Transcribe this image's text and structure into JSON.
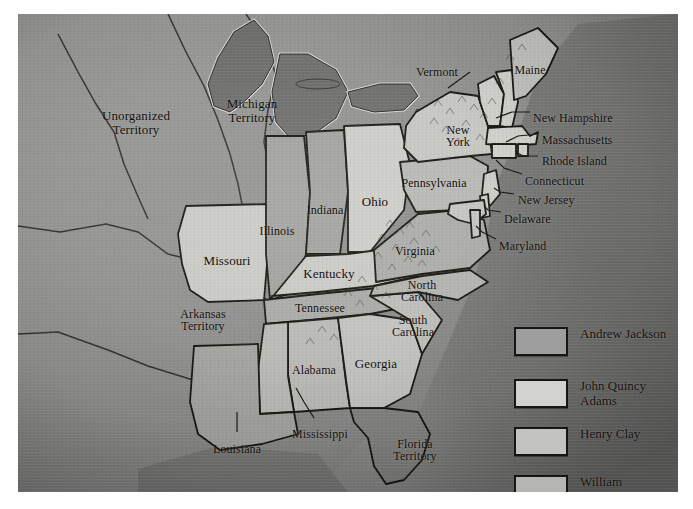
{
  "map": {
    "title_visible": false,
    "background_color": "#8e8e8e",
    "ocean_color": "#6f6f6f",
    "border_color": "#1a1713",
    "labels": [
      {
        "name": "unorganized-territory",
        "text": "Unorganized\nTerritory",
        "x": 118,
        "y": 95,
        "size": 13,
        "align": "c"
      },
      {
        "name": "michigan-territory",
        "text": "Michigan\nTerritory",
        "x": 234,
        "y": 83,
        "size": 13,
        "align": "c"
      },
      {
        "name": "missouri",
        "text": "Missouri",
        "x": 209,
        "y": 240,
        "size": 13,
        "align": "c"
      },
      {
        "name": "arkansas-territory",
        "text": "Arkansas\nTerritory",
        "x": 185,
        "y": 294,
        "size": 12,
        "align": "c"
      },
      {
        "name": "louisiana",
        "text": "Louisiana",
        "x": 219,
        "y": 429,
        "size": 12,
        "align": "c"
      },
      {
        "name": "mississippi",
        "text": "Mississippi",
        "x": 302,
        "y": 414,
        "size": 12,
        "align": "c"
      },
      {
        "name": "alabama",
        "text": "Alabama",
        "x": 296,
        "y": 350,
        "size": 12,
        "align": "c"
      },
      {
        "name": "illinois",
        "text": "Illinois",
        "x": 259,
        "y": 211,
        "size": 12,
        "align": "c"
      },
      {
        "name": "indiana",
        "text": "Indiana",
        "x": 307,
        "y": 190,
        "size": 12,
        "align": "c"
      },
      {
        "name": "ohio",
        "text": "Ohio",
        "x": 357,
        "y": 181,
        "size": 13,
        "align": "c"
      },
      {
        "name": "kentucky",
        "text": "Kentucky",
        "x": 311,
        "y": 253,
        "size": 13,
        "align": "c"
      },
      {
        "name": "tennessee",
        "text": "Tennessee",
        "x": 302,
        "y": 288,
        "size": 12,
        "align": "c"
      },
      {
        "name": "georgia",
        "text": "Georgia",
        "x": 358,
        "y": 343,
        "size": 13,
        "align": "c"
      },
      {
        "name": "south-carolina",
        "text": "South\nCarolina",
        "x": 395,
        "y": 300,
        "size": 12,
        "align": "c"
      },
      {
        "name": "north-carolina",
        "text": "North\nCarolina",
        "x": 404,
        "y": 265,
        "size": 12,
        "align": "c"
      },
      {
        "name": "virginia",
        "text": "Virginia",
        "x": 397,
        "y": 231,
        "size": 12,
        "align": "c"
      },
      {
        "name": "pennsylvania",
        "text": "Pennsylvania",
        "x": 416,
        "y": 163,
        "size": 12,
        "align": "c"
      },
      {
        "name": "new-york",
        "text": "New\nYork",
        "x": 440,
        "y": 110,
        "size": 12,
        "align": "c"
      },
      {
        "name": "vermont",
        "text": "Vermont",
        "x": 419,
        "y": 52,
        "size": 12,
        "align": "c"
      },
      {
        "name": "maine",
        "text": "Maine",
        "x": 512,
        "y": 50,
        "size": 12,
        "align": "c"
      },
      {
        "name": "florida-territory",
        "text": "Florida\nTerritory",
        "x": 397,
        "y": 424,
        "size": 12,
        "align": "c"
      },
      {
        "name": "new-hampshire",
        "text": "New Hampshire",
        "x": 515,
        "y": 98,
        "size": 12,
        "align": "l"
      },
      {
        "name": "massachusetts",
        "text": "Massachusetts",
        "x": 524,
        "y": 120,
        "size": 12,
        "align": "l"
      },
      {
        "name": "rhode-island",
        "text": "Rhode Island",
        "x": 524,
        "y": 141,
        "size": 12,
        "align": "l"
      },
      {
        "name": "connecticut",
        "text": "Connecticut",
        "x": 507,
        "y": 161,
        "size": 12,
        "align": "l"
      },
      {
        "name": "new-jersey",
        "text": "New Jersey",
        "x": 500,
        "y": 180,
        "size": 12,
        "align": "l"
      },
      {
        "name": "delaware",
        "text": "Delaware",
        "x": 486,
        "y": 199,
        "size": 12,
        "align": "l"
      },
      {
        "name": "maryland",
        "text": "Maryland",
        "x": 481,
        "y": 226,
        "size": 12,
        "align": "l"
      }
    ]
  },
  "legend": {
    "items": [
      {
        "name": "legend-andrew-jackson",
        "label": "Andrew Jackson",
        "color": "#9e9e9e",
        "y": 0
      },
      {
        "name": "legend-john-quincy-adams",
        "label": "John Quincy\nAdams",
        "color": "#d2d2d0",
        "y": 52
      },
      {
        "name": "legend-henry-clay",
        "label": "Henry Clay",
        "color": "#c3c3c0",
        "y": 100
      },
      {
        "name": "legend-william-crawford",
        "label": "William\nCrawford",
        "color": "#b5b5b2",
        "y": 148
      }
    ]
  }
}
